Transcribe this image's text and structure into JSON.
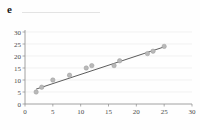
{
  "panel": {
    "letter": "e",
    "title": ""
  },
  "chart_data": {
    "type": "scatter",
    "title": "",
    "subtitle": "",
    "xlabel": "",
    "ylabel": "",
    "xlim": [
      0,
      30
    ],
    "ylim": [
      0,
      30
    ],
    "xticks": [
      0,
      5,
      10,
      15,
      20,
      25,
      30
    ],
    "yticks": [
      0,
      5,
      10,
      15,
      20,
      25,
      30
    ],
    "xticklabels": [
      "0",
      "5",
      "10",
      "15",
      "20",
      "25",
      "30"
    ],
    "yticklabels": [
      "0",
      "5",
      "10",
      "15",
      "20",
      "25",
      "30"
    ],
    "grid": "horizontal",
    "legend": "none",
    "marker": {
      "shape": "circle",
      "fill": "#b9b9b9",
      "edge": "#9a9a9a",
      "size": 2.2
    },
    "series": [
      {
        "name": "observations",
        "type": "scatter",
        "points": [
          {
            "x": 2,
            "y": 5
          },
          {
            "x": 3,
            "y": 7
          },
          {
            "x": 5,
            "y": 10
          },
          {
            "x": 8,
            "y": 12
          },
          {
            "x": 11,
            "y": 15
          },
          {
            "x": 12,
            "y": 16
          },
          {
            "x": 16,
            "y": 16
          },
          {
            "x": 17,
            "y": 18
          },
          {
            "x": 22,
            "y": 21
          },
          {
            "x": 23,
            "y": 22
          },
          {
            "x": 25,
            "y": 24
          }
        ]
      },
      {
        "name": "fit-line",
        "type": "line",
        "color": "#4a4a4a",
        "points": [
          {
            "x": 2,
            "y": 6.2
          },
          {
            "x": 25,
            "y": 23.8
          }
        ]
      }
    ]
  },
  "colors": {
    "background": "#fefefe",
    "axis": "#8a8a8a",
    "grid": "#ededed",
    "text": "#4a4a4a",
    "marker_fill": "#b9b9b9",
    "fit_line": "#4a4a4a"
  }
}
